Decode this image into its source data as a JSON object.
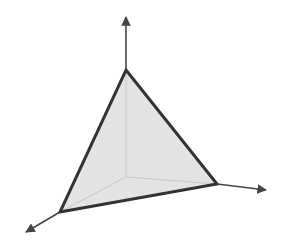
{
  "diagram": {
    "type": "3d-simplex-plane",
    "colors": {
      "background": "#ffffff",
      "axis": "#444444",
      "edge": "#333333",
      "fill": "#e4e4e4",
      "hidden_line": "#c8c8c8"
    },
    "origin": [
      126,
      177
    ],
    "vertices": {
      "top": [
        126,
        70
      ],
      "left": [
        60,
        212
      ],
      "right": [
        217,
        184
      ]
    },
    "axes": [
      {
        "name": "vertical-axis",
        "from": [
          126,
          70
        ],
        "to": [
          126,
          17
        ]
      },
      {
        "name": "right-axis",
        "from": [
          217,
          184
        ],
        "to": [
          266,
          190
        ]
      },
      {
        "name": "left-axis",
        "from": [
          60,
          212
        ],
        "to": [
          26,
          232
        ]
      }
    ],
    "hidden_lines": [
      {
        "from": [
          126,
          177
        ],
        "to": [
          126,
          70
        ]
      },
      {
        "from": [
          126,
          177
        ],
        "to": [
          60,
          212
        ]
      },
      {
        "from": [
          126,
          177
        ],
        "to": [
          217,
          184
        ]
      }
    ]
  }
}
